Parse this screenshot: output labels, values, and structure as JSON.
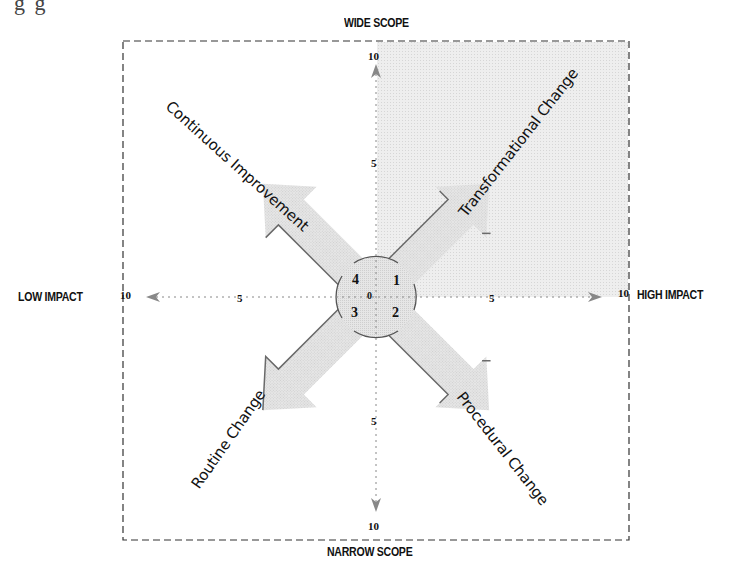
{
  "header_fragment": "g         g",
  "axes": {
    "top_label": "WIDE SCOPE",
    "bottom_label": "NARROW SCOPE",
    "left_label": "LOW IMPACT",
    "right_label": "HIGH IMPACT",
    "ticks": {
      "top_max": "10",
      "top_mid": "5",
      "bottom_max": "10",
      "bottom_mid": "5",
      "left_max": "10",
      "left_mid": "5",
      "right_max": "10",
      "right_mid": "5",
      "origin": "0"
    }
  },
  "quadrants": [
    {
      "number": "1",
      "label": "Transformational Change",
      "position": "top-right",
      "highlighted": true
    },
    {
      "number": "2",
      "label": "Procedural Change",
      "position": "bottom-right",
      "highlighted": false
    },
    {
      "number": "3",
      "label": "Routine Change",
      "position": "bottom-left",
      "highlighted": false
    },
    {
      "number": "4",
      "label": "Continuous Improvement",
      "position": "top-left",
      "highlighted": false
    }
  ],
  "colors": {
    "highlight_fill": "#ececec",
    "arrow_fill": "#e2e2e2",
    "arrow_edge": "#6a6a6a",
    "frame": "#333333",
    "axis": "#888888"
  }
}
